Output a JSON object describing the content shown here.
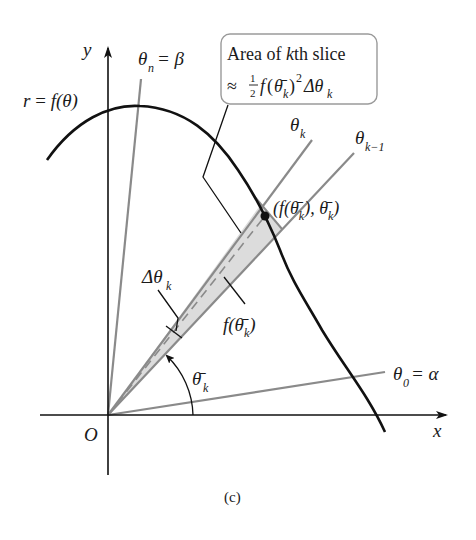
{
  "figure": {
    "caption": "(c)",
    "colors": {
      "ink": "#111111",
      "ray": "#8a8a8a",
      "wedge_fill": "#dcdcdc",
      "box_border": "#9a9a9a",
      "background": "#ffffff"
    }
  },
  "axes": {
    "x_label": "x",
    "y_label": "y",
    "origin_label": "O"
  },
  "curve": {
    "label_r": "r",
    "label_eq": "=",
    "label_f": "f(θ)"
  },
  "rays": {
    "theta_n": {
      "sym": "θ",
      "sub": "n",
      "rest": " = β"
    },
    "theta_0": {
      "sym": "θ",
      "sub": "0",
      "rest": " = α"
    },
    "theta_k": {
      "sym": "θ",
      "sub": "k"
    },
    "theta_k_minus_1": {
      "sym": "θ",
      "sub": "k−1"
    }
  },
  "callout_box": {
    "line1_a": "Area of ",
    "line1_k": "k",
    "line1_b": "th slice",
    "approx": "≈",
    "frac_num": "1",
    "frac_den": "2",
    "f": "f",
    "paren_open": "(",
    "theta_bar": "θ̄",
    "sub_k": "k",
    "paren_close": ")",
    "sup_2": "2",
    "delta": "Δθ",
    "delta_sub": "k"
  },
  "point_label": {
    "open": "(f(",
    "theta_bar": "θ̄",
    "sub_k": "k",
    "mid": "), ",
    "theta_bar2": "θ̄",
    "sub_k2": "k",
    "close": ")"
  },
  "labels": {
    "delta_theta": "Δθ",
    "delta_theta_sub": "k",
    "f_theta_bar": "f(θ̄",
    "f_theta_bar_sub": "k",
    "f_theta_bar_close": ")",
    "angle_theta_bar": "θ̄",
    "angle_theta_bar_sub": "k"
  }
}
